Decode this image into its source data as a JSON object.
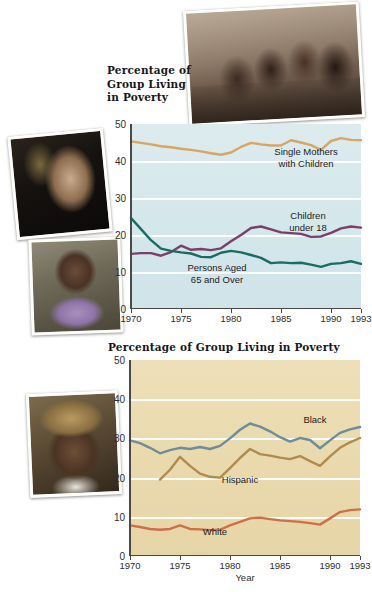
{
  "photos": [
    {
      "name": "children-at-table-photo",
      "caption": "Children seated at a table"
    },
    {
      "name": "young-woman-photo",
      "caption": "Young woman resting head on hands"
    },
    {
      "name": "older-woman-photo",
      "caption": "Older woman in lavender top"
    },
    {
      "name": "man-in-hat-photo",
      "caption": "Man wearing a straw hat"
    }
  ],
  "chart_data": [
    {
      "id": "top",
      "type": "line",
      "title": "Percentage of\nGroup Living\nin Poverty",
      "title_lines": [
        "Percentage of",
        "Group Living",
        "in Poverty"
      ],
      "xlabel": "",
      "ylabel": "",
      "ylim": [
        0,
        50
      ],
      "xlim": [
        1970,
        1993
      ],
      "yticks": [
        0,
        10,
        20,
        30,
        40,
        50
      ],
      "xticks": [
        1970,
        1975,
        1980,
        1985,
        1990,
        1993
      ],
      "grid": true,
      "background": "#d6e8ec",
      "legend_position": "inline",
      "x": [
        1970,
        1971,
        1972,
        1973,
        1974,
        1975,
        1976,
        1977,
        1978,
        1979,
        1980,
        1981,
        1982,
        1983,
        1984,
        1985,
        1986,
        1987,
        1988,
        1989,
        1990,
        1991,
        1992,
        1993
      ],
      "series": [
        {
          "name": "Single Mothers with Children",
          "color": "#d9a562",
          "label_text": "Single Mothers\nwith Children",
          "values": [
            45.3,
            44.9,
            44.5,
            44.0,
            43.7,
            43.3,
            43.0,
            42.6,
            42.1,
            41.7,
            42.3,
            43.8,
            44.9,
            44.5,
            44.2,
            44.2,
            45.6,
            45.0,
            44.3,
            43.0,
            45.4,
            46.2,
            45.7,
            45.6
          ]
        },
        {
          "name": "Children under 18",
          "color": "#7b3f6b",
          "label_text": "Children\nunder 18",
          "values": [
            14.9,
            15.1,
            15.1,
            14.4,
            15.4,
            17.1,
            16.0,
            16.2,
            15.9,
            16.4,
            18.3,
            20.0,
            21.9,
            22.3,
            21.5,
            20.7,
            20.5,
            20.3,
            19.5,
            19.6,
            20.6,
            21.8,
            22.3,
            22.0
          ]
        },
        {
          "name": "Persons Aged 65 and Over",
          "color": "#1a6b63",
          "label_text": "Persons Aged\n65 and Over",
          "values": [
            24.6,
            21.6,
            18.6,
            16.3,
            15.7,
            15.3,
            15.0,
            14.1,
            14.0,
            15.2,
            15.7,
            15.3,
            14.6,
            13.8,
            12.4,
            12.6,
            12.4,
            12.5,
            12.0,
            11.4,
            12.2,
            12.4,
            12.9,
            12.2
          ]
        }
      ]
    },
    {
      "id": "bottom",
      "type": "line",
      "title": "Percentage of Group Living in Poverty",
      "title_lines": [
        "Percentage of Group Living in Poverty"
      ],
      "xlabel": "Year",
      "ylabel": "",
      "ylim": [
        0,
        50
      ],
      "xlim": [
        1970,
        1993
      ],
      "yticks": [
        0,
        10,
        20,
        30,
        40,
        50
      ],
      "xticks": [
        1970,
        1975,
        1980,
        1985,
        1990,
        1993
      ],
      "grid": true,
      "background": "#e9d9ad",
      "legend_position": "inline",
      "x": [
        1970,
        1971,
        1972,
        1973,
        1974,
        1975,
        1976,
        1977,
        1978,
        1979,
        1980,
        1981,
        1982,
        1983,
        1984,
        1985,
        1986,
        1987,
        1988,
        1989,
        1990,
        1991,
        1992,
        1993
      ],
      "series": [
        {
          "name": "Black",
          "color": "#6e8c99",
          "label_text": "Black",
          "values": [
            29.5,
            28.8,
            27.6,
            26.2,
            27.0,
            27.6,
            27.3,
            27.8,
            27.3,
            28.1,
            30.0,
            32.2,
            33.8,
            33.0,
            31.8,
            30.3,
            29.2,
            30.1,
            29.6,
            27.5,
            29.5,
            31.4,
            32.3,
            32.9
          ]
        },
        {
          "name": "Hispanic",
          "color": "#b08a4e",
          "label_text": "Hispanic",
          "values": [
            null,
            null,
            null,
            19.5,
            22.0,
            25.3,
            23.0,
            21.0,
            20.2,
            20.0,
            22.4,
            25.0,
            27.3,
            26.0,
            25.6,
            25.1,
            24.7,
            25.5,
            24.2,
            23.0,
            25.4,
            27.6,
            29.0,
            30.1
          ],
          "note": "series begins 1973"
        },
        {
          "name": "White",
          "color": "#cf6f4a",
          "label_text": "White",
          "values": [
            7.8,
            7.4,
            6.9,
            6.7,
            6.9,
            7.8,
            6.9,
            6.8,
            6.6,
            6.7,
            7.8,
            8.7,
            9.6,
            9.8,
            9.4,
            9.1,
            8.9,
            8.7,
            8.4,
            8.0,
            9.6,
            11.2,
            11.7,
            11.9
          ]
        }
      ]
    }
  ]
}
